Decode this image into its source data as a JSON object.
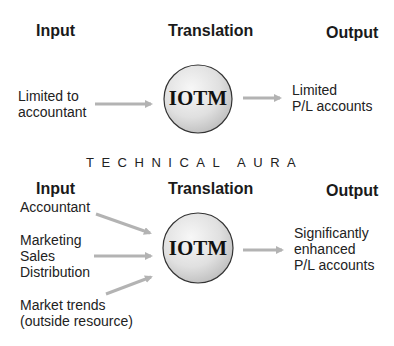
{
  "colors": {
    "arrow": "#b3b3b3",
    "circle_outline": "#333333",
    "circle_fill_light": "#f4f4f4",
    "circle_fill_dark": "#c8c8c8",
    "text": "#1a1a1a"
  },
  "top_panel": {
    "headers": {
      "input": "Input",
      "translation": "Translation",
      "output": "Output"
    },
    "input_label": "Limited to\naccountant",
    "node_label": "IOTM",
    "output_label": "Limited\nP/L accounts"
  },
  "divider_title": "TECHNICAL AURA",
  "bottom_panel": {
    "headers": {
      "input": "Input",
      "translation": "Translation",
      "output": "Output"
    },
    "inputs": [
      {
        "label": "Accountant"
      },
      {
        "label": "Marketing\nSales\nDistribution"
      },
      {
        "label": "Market trends\n(outside resource)"
      }
    ],
    "node_label": "IOTM",
    "output_label": "Significantly\nenhanced\nP/L accounts"
  }
}
